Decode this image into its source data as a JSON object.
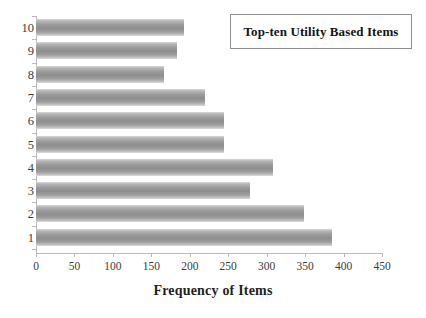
{
  "chart_data": {
    "type": "bar",
    "orientation": "horizontal",
    "title": "Top-ten Utility Based Items",
    "xlabel": "Frequency of Items",
    "ylabel": "",
    "categories": [
      "1",
      "2",
      "3",
      "4",
      "5",
      "6",
      "7",
      "8",
      "9",
      "10"
    ],
    "values": [
      385,
      348,
      278,
      308,
      245,
      245,
      220,
      166,
      184,
      192
    ],
    "series": [
      {
        "name": "Frequency of Items",
        "values": [
          385,
          348,
          278,
          308,
          245,
          245,
          220,
          166,
          184,
          192
        ]
      }
    ],
    "xlim": [
      0,
      450
    ],
    "xticks": [
      0,
      50,
      100,
      150,
      200,
      250,
      300,
      350,
      400,
      450
    ],
    "xtick_labels": [
      "0",
      "50",
      "100",
      "150",
      "200",
      "250",
      "300",
      "350",
      "400",
      "450"
    ],
    "ytick_labels": [
      "10",
      "9",
      "8",
      "7",
      "6",
      "5",
      "4",
      "3",
      "2",
      "1"
    ],
    "grid": false,
    "legend_position": "top-right",
    "bar_color": "#8e8e8e",
    "axis_color": "#b9b9b9",
    "text_color": "#3b3b3b",
    "background": "#ffffff"
  },
  "legend": {
    "label": "Top-ten Utility Based Items",
    "border_color": "#8d8d8d"
  },
  "axes": {
    "x_title": "Frequency of Items"
  }
}
